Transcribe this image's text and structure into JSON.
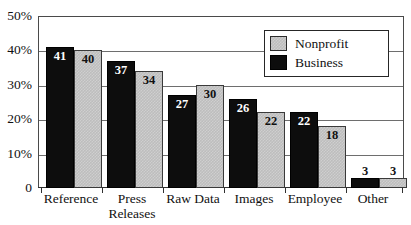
{
  "chart_data": {
    "type": "bar",
    "title": "",
    "subtitle": "",
    "xlabel": "",
    "ylabel": "",
    "ylim": [
      0,
      50
    ],
    "grid": true,
    "legend_position": "top-right",
    "categories": [
      "Reference",
      "Press\nReleases",
      "Raw Data",
      "Images",
      "Employee",
      "Other"
    ],
    "ytick_labels": [
      "0",
      "10%",
      "20%",
      "30%",
      "40%",
      "50%"
    ],
    "ytick_values": [
      0,
      10,
      20,
      30,
      40,
      50
    ],
    "series": [
      {
        "name": "Business",
        "color": "#0d0d0d",
        "values": [
          41,
          37,
          27,
          26,
          22,
          3
        ]
      },
      {
        "name": "Nonprofit",
        "color": "#bdbdbd",
        "values": [
          40,
          34,
          30,
          22,
          18,
          3
        ]
      }
    ]
  },
  "legend": {
    "entries": [
      {
        "label": "Nonprofit",
        "swatch": "nonprofit"
      },
      {
        "label": "Business",
        "swatch": "business"
      }
    ]
  }
}
